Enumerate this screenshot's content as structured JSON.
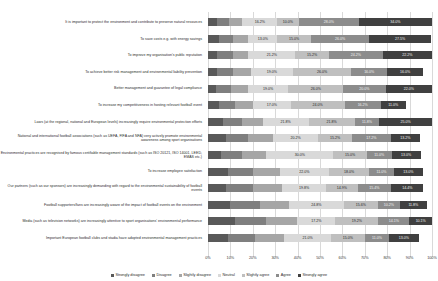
{
  "chart_data": {
    "type": "bar",
    "title": "",
    "subtitle": "",
    "xlabel": "",
    "ylabel": "",
    "orientation": "horizontal",
    "stacking": "100-percent-stacked",
    "xlim": [
      0,
      100
    ],
    "grid": true,
    "legend_position": "bottom",
    "xticks": [
      "0%",
      "10%",
      "20%",
      "30%",
      "40%",
      "50%",
      "60%",
      "70%",
      "80%",
      "90%",
      "100%"
    ],
    "xtick_values": [
      0,
      10,
      20,
      30,
      40,
      50,
      60,
      70,
      80,
      90,
      100
    ],
    "series": [
      {
        "name": "Strongly disagree",
        "color": "#595959",
        "values": [
          4.0,
          5.0,
          4.0,
          4.0,
          4.0,
          5.0,
          7.0,
          8.0,
          6.0,
          9.0,
          8.0,
          10.0,
          12.0,
          9.0
        ]
      },
      {
        "name": "Disagree",
        "color": "#7f7f7f",
        "values": [
          6.0,
          6.0,
          7.2,
          7.0,
          7.0,
          7.0,
          9.0,
          10.0,
          9.0,
          11.0,
          12.0,
          13.0,
          14.0,
          12.0
        ]
      },
      {
        "name": "Slightly disagree",
        "color": "#a6a6a6",
        "values": [
          6.0,
          7.0,
          7.0,
          8.0,
          8.0,
          8.0,
          10.0,
          11.0,
          11.0,
          12.0,
          13.0,
          13.0,
          14.0,
          13.0
        ]
      },
      {
        "name": "Neutral",
        "color": "#d9d9d9",
        "values": [
          16.2,
          13.0,
          21.2,
          19.0,
          19.0,
          17.0,
          21.8,
          20.2,
          30.0,
          22.0,
          19.8,
          24.8,
          17.2,
          21.0
        ]
      },
      {
        "name": "Slightly agree",
        "color": "#bfbfbf",
        "values": [
          10.0,
          15.0,
          15.2,
          26.0,
          26.0,
          24.0,
          21.8,
          15.2,
          15.0,
          18.0,
          14.0,
          15.0,
          19.2,
          15.0
        ]
      },
      {
        "name": "Agree",
        "color": "#8c8c8c",
        "values": [
          28.0,
          26.0,
          24.2,
          16.0,
          20.0,
          16.2,
          11.8,
          17.2,
          11.0,
          11.0,
          15.0,
          10.0,
          14.0,
          11.0
        ]
      },
      {
        "name": "Strongly agree",
        "color": "#404040",
        "values": [
          34.0,
          27.5,
          22.2,
          16.0,
          22.0,
          11.0,
          25.0,
          13.0,
          13.0,
          13.0,
          14.4,
          11.8,
          10.1,
          13.0
        ]
      }
    ],
    "categories": [
      "It is important to protect the environment and contribute to preserve natural resources",
      "To save costs e.g. with energy savings",
      "To improve my organisation's public reputation",
      "To achieve better risk management and environmental liability prevention",
      "Better management and guarantee of legal compliance",
      "To increase my competitiveness in hosting relevant football event",
      "Laws (at the regional, national and European levels) increasingly require environmental protection efforts",
      "National and international football associations (such as UEFA, FIFA and NFA) very actively promote environmental awareness among sport organisations",
      "Environmental practices are recognised by famous certifiable management standards (such as ISO 20121, ISO 14001, LEED, EMAS etc.)",
      "To increase employee satisfaction",
      "Our partners (such as our sponsors) are increasingly demanding with regard to the environmental sustainability of football events",
      "Football supporters/fans are increasingly aware of the impact of football events on the environment",
      "Media (such as television networks) are increasingly attentive to sport organisations' environmental performance",
      "Important European football clubs and stadia have adopted environmental management practices"
    ],
    "data_labels": [
      {
        "row": 0,
        "labels": [
          {
            "series": "Neutral",
            "text": "16.2%"
          },
          {
            "series": "Slightly agree",
            "text": "10.0%"
          },
          {
            "series": "Agree",
            "text": "28.0%"
          },
          {
            "series": "Strongly agree",
            "text": "34.0%"
          }
        ]
      },
      {
        "row": 1,
        "labels": [
          {
            "series": "Neutral",
            "text": "13.0%"
          },
          {
            "series": "Slightly agree",
            "text": "15.0%"
          },
          {
            "series": "Agree",
            "text": "26.0%"
          },
          {
            "series": "Strongly agree",
            "text": "27.5%"
          }
        ]
      },
      {
        "row": 2,
        "labels": [
          {
            "series": "Neutral",
            "text": "21.2%"
          },
          {
            "series": "Slightly agree",
            "text": "15.2%"
          },
          {
            "series": "Agree",
            "text": "24.2%"
          },
          {
            "series": "Strongly agree",
            "text": "22.2%"
          }
        ]
      },
      {
        "row": 3,
        "labels": [
          {
            "series": "Neutral",
            "text": "19.0%"
          },
          {
            "series": "Slightly agree",
            "text": "26.0%"
          },
          {
            "series": "Agree",
            "text": "16.0%"
          },
          {
            "series": "Strongly agree",
            "text": "16.0%"
          }
        ]
      },
      {
        "row": 4,
        "labels": [
          {
            "series": "Neutral",
            "text": "19.0%"
          },
          {
            "series": "Slightly agree",
            "text": "26.0%"
          },
          {
            "series": "Agree",
            "text": "20.0%"
          },
          {
            "series": "Strongly agree",
            "text": "22.0%"
          }
        ]
      },
      {
        "row": 5,
        "labels": [
          {
            "series": "Neutral",
            "text": "17.0%"
          },
          {
            "series": "Slightly agree",
            "text": "24.0%"
          },
          {
            "series": "Agree",
            "text": "16.2%"
          },
          {
            "series": "Strongly agree",
            "text": "11.0%"
          }
        ]
      },
      {
        "row": 6,
        "labels": [
          {
            "series": "Neutral",
            "text": "21.8%"
          },
          {
            "series": "Slightly agree",
            "text": "21.8%"
          },
          {
            "series": "Agree",
            "text": "11.8%"
          },
          {
            "series": "Strongly agree",
            "text": "25.0%"
          }
        ]
      },
      {
        "row": 7,
        "labels": [
          {
            "series": "Neutral",
            "text": "20.2%"
          },
          {
            "series": "Slightly agree",
            "text": "15.2%"
          },
          {
            "series": "Agree",
            "text": "17.2%"
          },
          {
            "series": "Strongly agree",
            "text": "13.2%"
          }
        ]
      },
      {
        "row": 8,
        "labels": [
          {
            "series": "Neutral",
            "text": "30.0%"
          },
          {
            "series": "Slightly agree",
            "text": "15.0%"
          },
          {
            "series": "Agree",
            "text": "11.0%"
          },
          {
            "series": "Strongly agree",
            "text": "13.0%"
          }
        ]
      },
      {
        "row": 9,
        "labels": [
          {
            "series": "Neutral",
            "text": "22.0%"
          },
          {
            "series": "Slightly agree",
            "text": "18.0%"
          },
          {
            "series": "Agree",
            "text": "11.0%"
          },
          {
            "series": "Strongly agree",
            "text": "13.0%"
          }
        ]
      },
      {
        "row": 10,
        "labels": [
          {
            "series": "Neutral",
            "text": "19.8%"
          },
          {
            "series": "Slightly agree",
            "text": "14.9%"
          },
          {
            "series": "Agree",
            "text": "15.4%"
          },
          {
            "series": "Strongly agree",
            "text": "14.4%"
          }
        ]
      },
      {
        "row": 11,
        "labels": [
          {
            "series": "Neutral",
            "text": "24.8%"
          },
          {
            "series": "Slightly agree",
            "text": "15.6%"
          },
          {
            "series": "Agree",
            "text": "10.2%"
          },
          {
            "series": "Strongly agree",
            "text": "11.8%"
          }
        ]
      },
      {
        "row": 12,
        "labels": [
          {
            "series": "Neutral",
            "text": "17.2%"
          },
          {
            "series": "Slightly agree",
            "text": "19.2%"
          },
          {
            "series": "Agree",
            "text": "14.1%"
          },
          {
            "series": "Strongly agree",
            "text": "10.1%"
          }
        ]
      },
      {
        "row": 13,
        "labels": [
          {
            "series": "Neutral",
            "text": "21.0%"
          },
          {
            "series": "Slightly agree",
            "text": "15.0%"
          },
          {
            "series": "Agree",
            "text": "11.0%"
          },
          {
            "series": "Strongly agree",
            "text": "13.0%"
          }
        ]
      }
    ]
  }
}
